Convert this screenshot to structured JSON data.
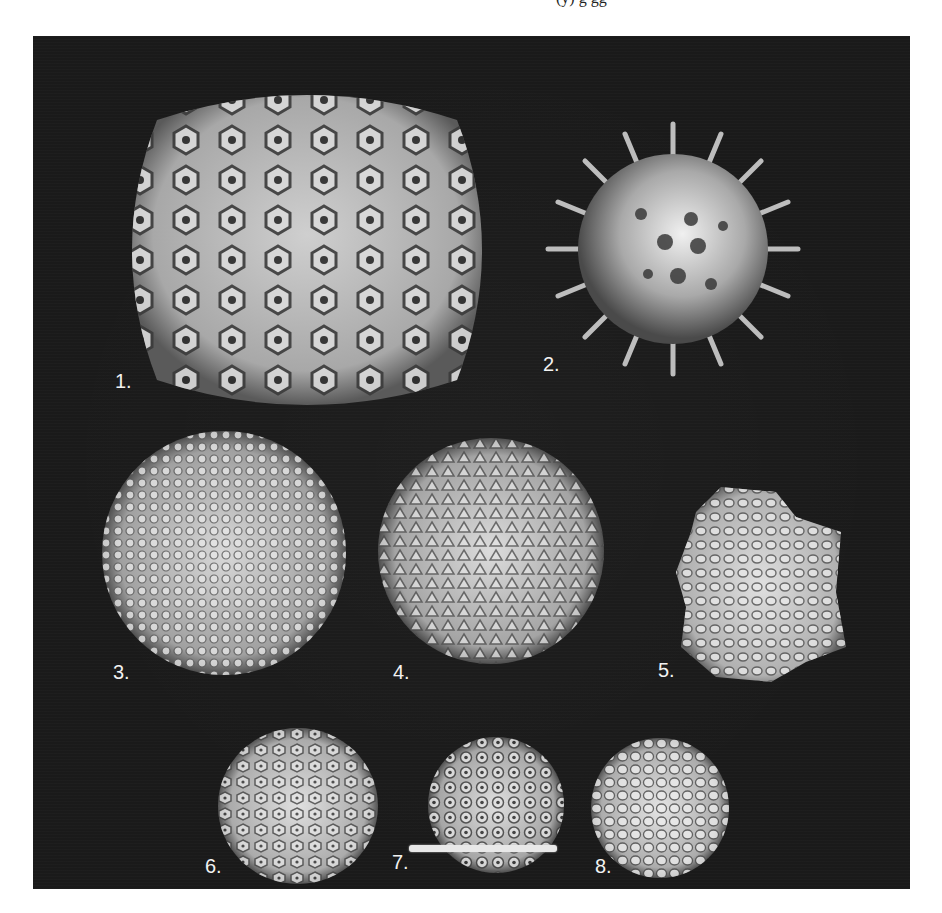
{
  "page": {
    "background": "#ffffff",
    "top_clipped_text": "(y) g gg",
    "bottom_clipped_text": ""
  },
  "plate": {
    "background": "#1a1a1a",
    "label_color": "#f2f2f2",
    "panels": [
      {
        "id": 1,
        "label": "1.",
        "shape": "large icosahedral capsid with hexameric capsomers"
      },
      {
        "id": 2,
        "label": "2.",
        "shape": "spherical capsid with protruding spikes"
      },
      {
        "id": 3,
        "label": "3.",
        "shape": "large knobbly icosahedral capsid"
      },
      {
        "id": 4,
        "label": "4.",
        "shape": "large icosahedral capsid with trimeric surface"
      },
      {
        "id": 5,
        "label": "5.",
        "shape": "capsid with turret-like vertex protrusions"
      },
      {
        "id": 6,
        "label": "6.",
        "shape": "small icosahedral capsid"
      },
      {
        "id": 7,
        "label": "7.",
        "shape": "small icosahedral capsid with pentameric capsomers"
      },
      {
        "id": 8,
        "label": "8.",
        "shape": "small knobbly icosahedral capsid"
      }
    ],
    "scale_bar": {
      "color": "#e8e8e8"
    }
  }
}
